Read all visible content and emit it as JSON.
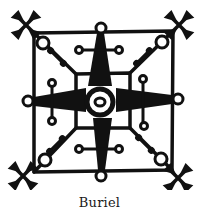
{
  "figure": {
    "caption": "Buriel",
    "ink_color": "#111111",
    "background_color": "#ffffff"
  }
}
